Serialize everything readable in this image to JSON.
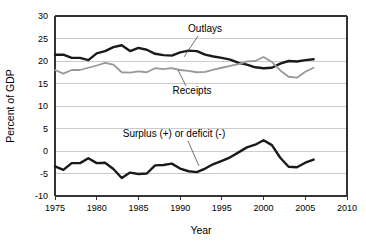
{
  "chart_data": {
    "type": "line",
    "title": "",
    "xlabel": "Year",
    "ylabel": "Percent of GDP",
    "xlim": [
      1975,
      2010
    ],
    "ylim": [
      -10,
      30
    ],
    "xticks": [
      1975,
      1980,
      1985,
      1990,
      1995,
      2000,
      2005,
      2010
    ],
    "yticks": [
      -10,
      -5,
      0,
      5,
      10,
      15,
      20,
      25,
      30
    ],
    "xtick_labels": [
      "1975",
      "1980",
      "1985",
      "1990",
      "1995",
      "2000",
      "2005",
      "2010"
    ],
    "ytick_labels": [
      "-10",
      "-5",
      "0",
      "5",
      "10",
      "15",
      "20",
      "25",
      "30"
    ],
    "grid": "horizontal",
    "legend_position": "inline-annotations",
    "x": [
      1975,
      1976,
      1977,
      1978,
      1979,
      1980,
      1981,
      1982,
      1983,
      1984,
      1985,
      1986,
      1987,
      1988,
      1989,
      1990,
      1991,
      1992,
      1993,
      1994,
      1995,
      1996,
      1997,
      1998,
      1999,
      2000,
      2001,
      2002,
      2003,
      2004,
      2005,
      2006
    ],
    "series": [
      {
        "name": "Outlays",
        "color": "#1a1a1a",
        "width": 2.4,
        "values": [
          21.4,
          21.4,
          20.7,
          20.7,
          20.2,
          21.7,
          22.2,
          23.1,
          23.5,
          22.2,
          22.9,
          22.5,
          21.6,
          21.3,
          21.2,
          21.9,
          22.3,
          22.2,
          21.4,
          21.0,
          20.7,
          20.3,
          19.6,
          19.2,
          18.6,
          18.4,
          18.5,
          19.4,
          20.0,
          19.9,
          20.2,
          20.4
        ]
      },
      {
        "name": "Receipts",
        "color": "#999999",
        "width": 1.8,
        "values": [
          18.0,
          17.2,
          18.0,
          18.0,
          18.5,
          19.0,
          19.6,
          19.2,
          17.5,
          17.4,
          17.7,
          17.5,
          18.4,
          18.2,
          18.4,
          18.0,
          17.8,
          17.5,
          17.6,
          18.1,
          18.5,
          18.9,
          19.3,
          19.9,
          20.0,
          20.9,
          19.8,
          17.9,
          16.5,
          16.3,
          17.6,
          18.5
        ]
      },
      {
        "name": "Surplus (+) or deficit (-)",
        "color": "#1a1a1a",
        "width": 2.4,
        "values": [
          -3.4,
          -4.2,
          -2.7,
          -2.7,
          -1.6,
          -2.7,
          -2.6,
          -4.0,
          -6.0,
          -4.8,
          -5.1,
          -5.0,
          -3.2,
          -3.1,
          -2.8,
          -3.9,
          -4.5,
          -4.7,
          -3.9,
          -2.9,
          -2.2,
          -1.4,
          -0.3,
          0.8,
          1.4,
          2.4,
          1.3,
          -1.5,
          -3.5,
          -3.6,
          -2.6,
          -1.9
        ]
      }
    ],
    "annotations": [
      {
        "text": "Outlays",
        "label_x": 205,
        "label_y": 32,
        "anchor": "middle",
        "leader_from_x": 198,
        "leader_from_y": 36,
        "leader_to_x": 184,
        "leader_to_y": 57
      },
      {
        "text": "Receipts",
        "label_x": 192,
        "label_y": 94,
        "anchor": "middle",
        "leader_from_x": 186,
        "leader_from_y": 86,
        "leader_to_x": 178,
        "leader_to_y": 70
      },
      {
        "text": "Surplus (+) or deficit (-)",
        "label_x": 174,
        "label_y": 137,
        "anchor": "middle",
        "leader_from_x": 188,
        "leader_from_y": 141,
        "leader_to_x": 199,
        "leader_to_y": 166
      }
    ]
  },
  "axes": {
    "ylabel": "Percent of GDP",
    "xlabel": "Year"
  }
}
